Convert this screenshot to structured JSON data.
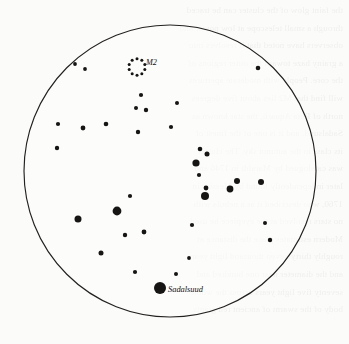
{
  "chart": {
    "type": "star-chart",
    "title": "",
    "width": 349,
    "height": 344,
    "background_color": "#fbfbfa",
    "ink_color": "#161514",
    "field_of_view_circle": {
      "center_x": 170,
      "center_y": 171,
      "radius": 146,
      "stroke_color": "#23211f",
      "stroke_width": 1.15
    }
  },
  "chart_data": {
    "type": "scatter",
    "title": "",
    "xlabel": "",
    "ylabel": "",
    "projection": "circular field of view",
    "grid": false,
    "legend": "none",
    "note": "Finder chart for globular cluster M2 in Aquarius; dot radius encodes stellar magnitude (larger = brighter).",
    "stars": [
      {
        "x": 75,
        "y": 64,
        "r": 1.9
      },
      {
        "x": 85,
        "y": 69,
        "r": 1.9
      },
      {
        "x": 141,
        "y": 95,
        "r": 2.1
      },
      {
        "x": 146,
        "y": 110,
        "r": 2.2
      },
      {
        "x": 258,
        "y": 68,
        "r": 2.3
      },
      {
        "x": 177,
        "y": 103,
        "r": 2.0
      },
      {
        "x": 58,
        "y": 124,
        "r": 2.1
      },
      {
        "x": 136,
        "y": 108,
        "r": 2.0
      },
      {
        "x": 106,
        "y": 124,
        "r": 2.3
      },
      {
        "x": 83,
        "y": 128,
        "r": 2.4
      },
      {
        "x": 138,
        "y": 132,
        "r": 2.2
      },
      {
        "x": 57,
        "y": 148,
        "r": 2.2
      },
      {
        "x": 171,
        "y": 127,
        "r": 2.1
      },
      {
        "x": 200,
        "y": 149,
        "r": 2.3
      },
      {
        "x": 207,
        "y": 154,
        "r": 2.5
      },
      {
        "x": 196,
        "y": 163,
        "r": 3.6
      },
      {
        "x": 199,
        "y": 175,
        "r": 2.1
      },
      {
        "x": 237,
        "y": 181,
        "r": 3.0
      },
      {
        "x": 206,
        "y": 188,
        "r": 2.4
      },
      {
        "x": 261,
        "y": 182,
        "r": 3.0
      },
      {
        "x": 205,
        "y": 196,
        "r": 4.0
      },
      {
        "x": 230,
        "y": 189,
        "r": 3.4
      },
      {
        "x": 117,
        "y": 211,
        "r": 4.4
      },
      {
        "x": 78,
        "y": 219,
        "r": 3.5
      },
      {
        "x": 130,
        "y": 196,
        "r": 2.1
      },
      {
        "x": 192,
        "y": 225,
        "r": 2.1
      },
      {
        "x": 144,
        "y": 232,
        "r": 2.4
      },
      {
        "x": 265,
        "y": 223,
        "r": 2.0
      },
      {
        "x": 270,
        "y": 240,
        "r": 2.2
      },
      {
        "x": 101,
        "y": 253,
        "r": 2.5
      },
      {
        "x": 125,
        "y": 235,
        "r": 2.2
      },
      {
        "x": 135,
        "y": 272,
        "r": 2.1
      },
      {
        "x": 176,
        "y": 274,
        "r": 2.0
      },
      {
        "x": 189,
        "y": 258,
        "r": 1.9
      },
      {
        "x": 160,
        "y": 288,
        "r": 6.0,
        "label": "Sadalsuud",
        "label_dx": 8,
        "label_dy": 3.5
      }
    ],
    "deep_sky_objects": [
      {
        "name": "M2",
        "symbol": "dotted-circle",
        "center_x": 137,
        "center_y": 67,
        "symbol_radius": 8.2,
        "dot_count": 10,
        "dot_radius": 1.5,
        "label": "M2",
        "label_dx": 9,
        "label_dy": -2
      }
    ]
  },
  "bleed_text": {
    "lines": [
      "the faint glow of the cluster can be traced",
      "through a small telescope at low power and",
      "observers have noted that it resolves into",
      "a grainy haze toward the outer regions of",
      "the core. People with moderate apertures",
      "will find that M2 lies about five degrees",
      "north of Beta Aquarii, the star known as",
      "Sadalsuud, and it is one of the finest of",
      "its class in the autumn sky. The cluster",
      "was catalogued by Maraldi in 1746 and",
      "later independently found by Messier in",
      "1760, who described it as a nebula with",
      "no stars resolved at the eyepiece he used.",
      "Modern estimates place the distance at",
      "roughly thirty-seven thousand light years",
      "and the diameter near one hundred and",
      "seventy five light years across the whole",
      "body of the swarm of ancient red giants."
    ]
  }
}
